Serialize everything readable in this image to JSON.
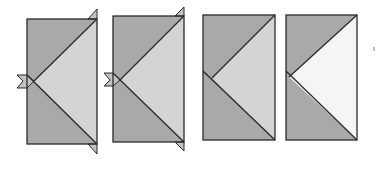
{
  "diagram": {
    "colors": {
      "background": "#ffffff",
      "dark_fabric": "#a9a9a9",
      "light_fabric": "#d4d4d4",
      "white_fabric": "#f5f5f5",
      "outline": "#2a2a2a",
      "dog_ear": "#c2c2c2"
    },
    "panels": [
      {
        "id": 1,
        "label": "Step 1: two dark squares sewn on, dog ears visible",
        "x": 27,
        "y": 19,
        "w": 70,
        "h": 125,
        "center_fill": "light_fabric",
        "dog_ears": true
      },
      {
        "id": 2,
        "label": "Step 2: dog ears visible",
        "x": 113,
        "y": 16,
        "w": 71,
        "h": 126,
        "center_fill": "light_fabric",
        "dog_ears": true
      },
      {
        "id": 3,
        "label": "Step 3: trimmed unit",
        "x": 203,
        "y": 15,
        "w": 72,
        "h": 125,
        "center_fill": "light_fabric",
        "dog_ears": false
      },
      {
        "id": 4,
        "label": "Step 4: trimmed unit, white center",
        "x": 286,
        "y": 15,
        "w": 71,
        "h": 125,
        "center_fill": "white_fabric",
        "dog_ears": false
      }
    ]
  }
}
